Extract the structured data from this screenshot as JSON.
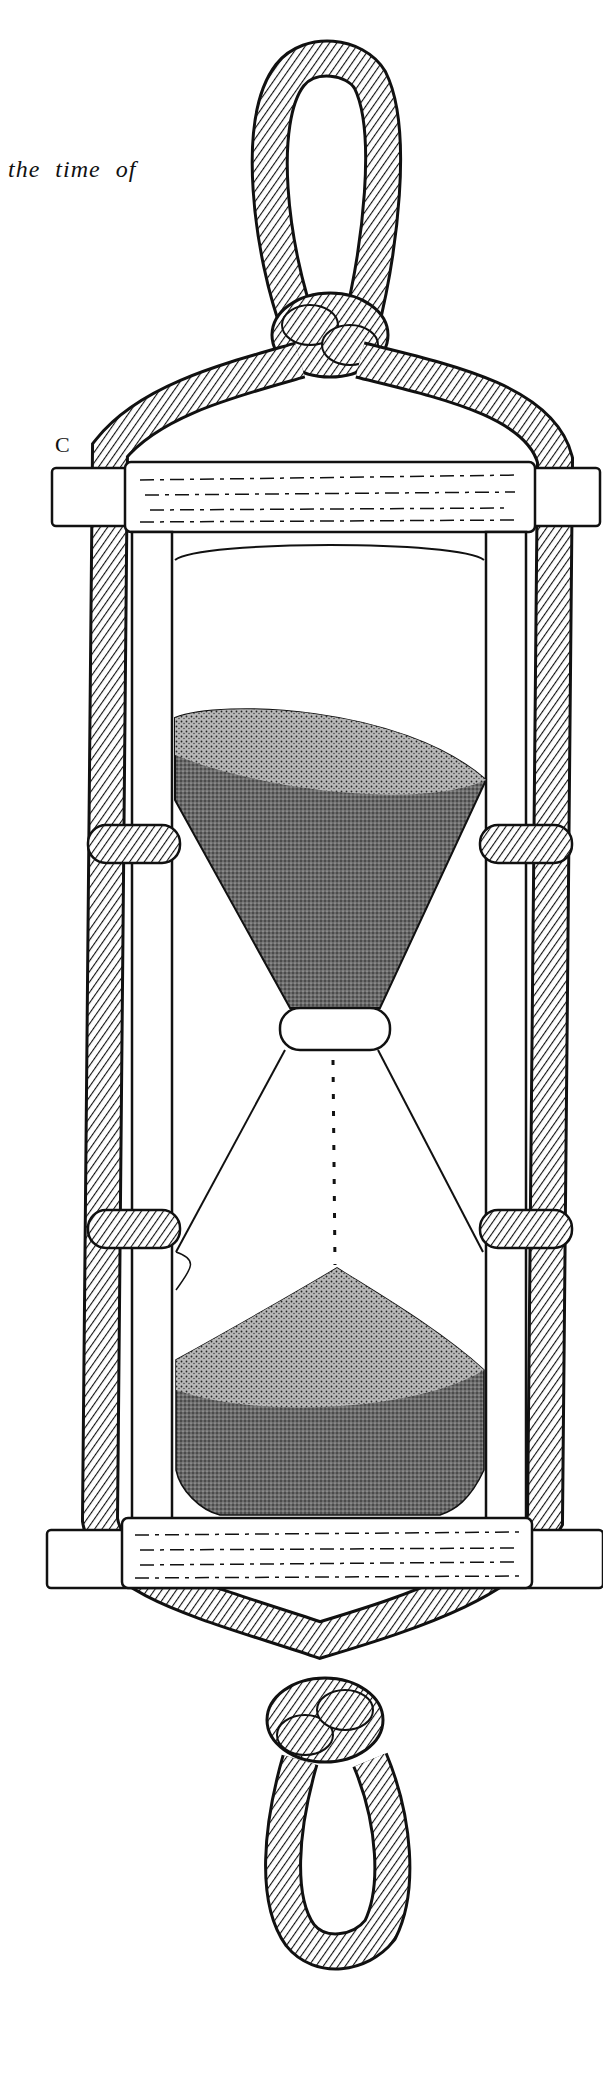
{
  "page": {
    "caption_fragment": "the time of",
    "figure_label": "C"
  },
  "illustration": {
    "subject": "hourglass-in-wooden-frame-wrapped-with-rope",
    "elements": [
      "top-rope-loop",
      "top-knot",
      "top-board",
      "bottom-board",
      "left-post",
      "right-post",
      "upper-bulb-sand",
      "neck",
      "falling-sand-stream",
      "lower-bulb-sand-pile",
      "rope-bindings",
      "bottom-knot",
      "bottom-rope-loop"
    ],
    "colors": {
      "ink": "#111111",
      "paper": "#ffffff",
      "sand": "#5a5a5a"
    }
  }
}
